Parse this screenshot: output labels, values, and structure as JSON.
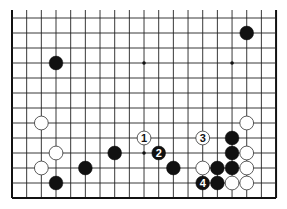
{
  "diagram": {
    "type": "go-board-fragment",
    "columns": 19,
    "rows_visible": 13,
    "edges": [
      "left",
      "right",
      "bottom"
    ],
    "grid": {
      "x0": 12,
      "dx": 14.67,
      "y0": 18,
      "dy": 15,
      "top_extension": 8
    },
    "colors": {
      "line": "#222222",
      "edge": "#111111",
      "black": "#111111",
      "white": "#ffffff",
      "white_stroke": "#333333",
      "background": "#ffffff"
    },
    "star_points": [
      {
        "col": 9,
        "row": 3
      },
      {
        "col": 15,
        "row": 3
      },
      {
        "col": 9,
        "row": 9
      }
    ],
    "stones": [
      {
        "col": 3,
        "row": 3,
        "color": "black"
      },
      {
        "col": 16,
        "row": 1,
        "color": "black"
      },
      {
        "col": 2,
        "row": 7,
        "color": "white"
      },
      {
        "col": 16,
        "row": 7,
        "color": "white"
      },
      {
        "col": 3,
        "row": 9,
        "color": "white"
      },
      {
        "col": 2,
        "row": 10,
        "color": "white"
      },
      {
        "col": 3,
        "row": 11,
        "color": "black"
      },
      {
        "col": 5,
        "row": 10,
        "color": "black"
      },
      {
        "col": 7,
        "row": 9,
        "color": "black"
      },
      {
        "col": 9,
        "row": 8,
        "color": "white",
        "label": "1"
      },
      {
        "col": 10,
        "row": 9,
        "color": "black",
        "label": "2"
      },
      {
        "col": 11,
        "row": 10,
        "color": "black"
      },
      {
        "col": 13,
        "row": 8,
        "color": "white",
        "label": "3"
      },
      {
        "col": 13,
        "row": 10,
        "color": "white"
      },
      {
        "col": 13,
        "row": 11,
        "color": "black",
        "label": "4"
      },
      {
        "col": 15,
        "row": 8,
        "color": "black"
      },
      {
        "col": 15,
        "row": 9,
        "color": "black"
      },
      {
        "col": 16,
        "row": 9,
        "color": "white"
      },
      {
        "col": 14,
        "row": 10,
        "color": "black"
      },
      {
        "col": 15,
        "row": 10,
        "color": "black"
      },
      {
        "col": 16,
        "row": 10,
        "color": "white"
      },
      {
        "col": 14,
        "row": 11,
        "color": "black"
      },
      {
        "col": 15,
        "row": 11,
        "color": "white"
      },
      {
        "col": 16,
        "row": 11,
        "color": "white"
      }
    ]
  }
}
